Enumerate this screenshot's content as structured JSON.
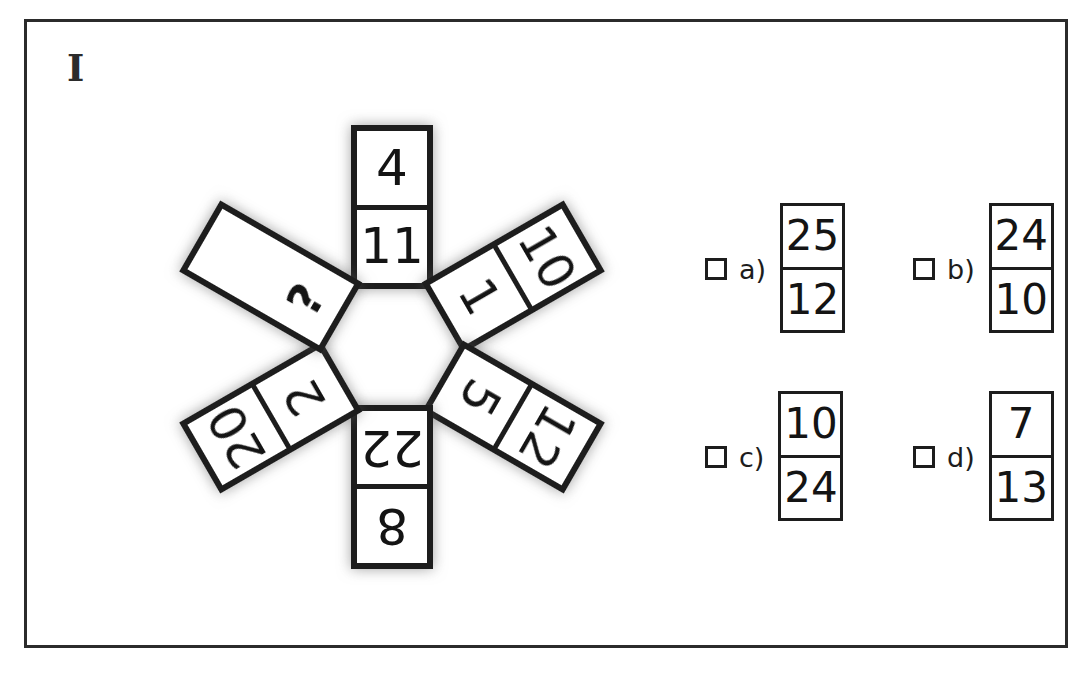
{
  "item": {
    "label": "I"
  },
  "puzzle": {
    "type": "domino-pinwheel",
    "center_shape": "hexagon",
    "spoke_count": 6,
    "tiles": [
      {
        "position": "top",
        "angle_deg": 0,
        "outer": "4",
        "inner": "11",
        "is_question": false
      },
      {
        "position": "upper-right",
        "angle_deg": 60,
        "outer": "10",
        "inner": "1",
        "is_question": false
      },
      {
        "position": "lower-right",
        "angle_deg": 120,
        "outer": "12",
        "inner": "5",
        "is_question": false
      },
      {
        "position": "bottom",
        "angle_deg": 180,
        "outer": "8",
        "inner": "22",
        "is_question": false
      },
      {
        "position": "lower-left",
        "angle_deg": 240,
        "outer": "20",
        "inner": "2",
        "is_question": false
      },
      {
        "position": "upper-left",
        "angle_deg": 300,
        "outer": "",
        "inner": "?",
        "is_question": true
      }
    ]
  },
  "options": [
    {
      "key": "a",
      "label": "a)",
      "top": "25",
      "bottom": "12",
      "checked": false
    },
    {
      "key": "b",
      "label": "b)",
      "top": "24",
      "bottom": "10",
      "checked": false
    },
    {
      "key": "c",
      "label": "c)",
      "top": "10",
      "bottom": "24",
      "checked": false
    },
    {
      "key": "d",
      "label": "d)",
      "top": "7",
      "bottom": "13",
      "checked": false
    }
  ],
  "colors": {
    "ink": "#1d1d1d",
    "frame": "#2b2b2b",
    "paper": "#ffffff",
    "shadow": "rgba(90,90,90,0.55)"
  }
}
